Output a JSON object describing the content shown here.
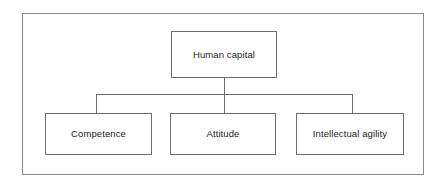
{
  "diagram": {
    "type": "hierarchy-tree",
    "colors": {
      "background": "#ffffff",
      "frame_border": "#8a8a8a",
      "node_border": "#6d6d6d",
      "connector": "#6d6d6d",
      "text": "#1c1c1c"
    },
    "root": {
      "label": "Human capital"
    },
    "children": [
      {
        "label": "Competence"
      },
      {
        "label": "Attitude"
      },
      {
        "label": "Intellectual agility"
      }
    ]
  }
}
